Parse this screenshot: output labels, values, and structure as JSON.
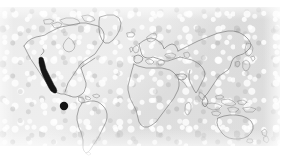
{
  "figure": {
    "type": "world-distribution-map",
    "projection": "equirectangular",
    "caption": "",
    "background_color": "#e4e4e4",
    "paper_color": "#ffffff",
    "coastline_color": "#6f6f6f",
    "range_color": "#151515",
    "plate": {
      "x": 0,
      "y": 7,
      "width": 280,
      "height": 139
    }
  },
  "legend": {
    "range_shading_label": "shaded distribution range",
    "point_record_label": "isolated record"
  },
  "landmasses": [
    {
      "name": "north-america"
    },
    {
      "name": "central-america"
    },
    {
      "name": "south-america"
    },
    {
      "name": "greenland"
    },
    {
      "name": "europe"
    },
    {
      "name": "africa"
    },
    {
      "name": "asia"
    },
    {
      "name": "southeast-asia-islands"
    },
    {
      "name": "australia"
    },
    {
      "name": "new-zealand"
    },
    {
      "name": "japan"
    },
    {
      "name": "british-isles"
    },
    {
      "name": "madagascar"
    },
    {
      "name": "iceland"
    }
  ],
  "occurrences": {
    "shaded_regions": [
      {
        "name": "pacific-coast-north-america",
        "region_label": "California and Baja California coast",
        "approx_center": {
          "x": 46,
          "y": 80
        }
      }
    ],
    "point_records": [
      {
        "name": "eastern-pacific-record",
        "region_label": "Eastern tropical Pacific",
        "x": 64,
        "y": 106,
        "radius": 4.2
      }
    ]
  }
}
